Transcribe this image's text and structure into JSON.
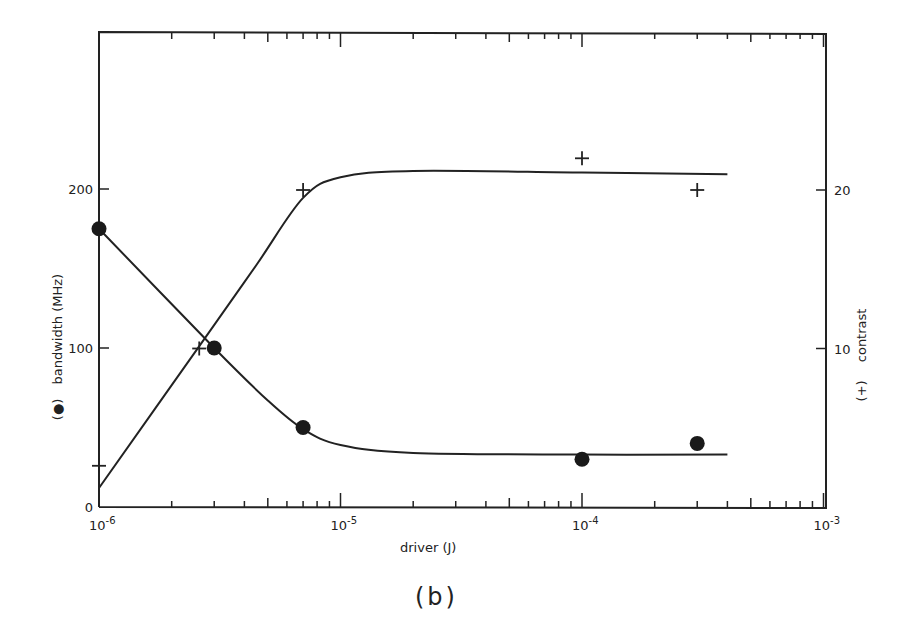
{
  "chart_data": {
    "type": "scatter",
    "title": "",
    "caption": "(b)",
    "xlabel": "driver (J)",
    "ylabel_left": "bandwidth (MHz)",
    "ylabel_left_marker": "(●)",
    "ylabel_right": "contrast",
    "ylabel_right_marker": "(+)",
    "x_scale": "log",
    "xlim": [
      1e-06,
      0.001
    ],
    "x_ticks": [
      {
        "value": 1e-06,
        "base": "10",
        "exp": "-6"
      },
      {
        "value": 1e-05,
        "base": "10",
        "exp": "-5"
      },
      {
        "value": 0.0001,
        "base": "10",
        "exp": "-4"
      },
      {
        "value": 0.001,
        "base": "10",
        "exp": "-3"
      }
    ],
    "ylim_left": [
      0,
      300
    ],
    "y_ticks_left": [
      0,
      100,
      200
    ],
    "ylim_right": [
      0,
      30
    ],
    "y_ticks_right": [
      10,
      20
    ],
    "grid": false,
    "legend": "none (markers identified in axis labels)",
    "series": [
      {
        "name": "bandwidth (MHz)",
        "marker": "filled-circle",
        "axis": "left",
        "points": [
          {
            "x": 1e-06,
            "y": 175
          },
          {
            "x": 3e-06,
            "y": 100
          },
          {
            "x": 7e-06,
            "y": 50
          },
          {
            "x": 0.0001,
            "y": 30
          },
          {
            "x": 0.0003,
            "y": 40
          }
        ],
        "fit_curve": [
          {
            "x": 1e-06,
            "y": 175
          },
          {
            "x": 3e-06,
            "y": 100
          },
          {
            "x": 5e-06,
            "y": 67
          },
          {
            "x": 7e-06,
            "y": 49
          },
          {
            "x": 1e-05,
            "y": 39
          },
          {
            "x": 2e-05,
            "y": 34
          },
          {
            "x": 0.0001,
            "y": 33
          },
          {
            "x": 0.0004,
            "y": 33
          }
        ]
      },
      {
        "name": "contrast",
        "marker": "plus",
        "axis": "right",
        "points": [
          {
            "x": 1e-06,
            "y": 2.6
          },
          {
            "x": 2.6e-06,
            "y": 10
          },
          {
            "x": 7e-06,
            "y": 20
          },
          {
            "x": 0.0001,
            "y": 22
          },
          {
            "x": 0.0003,
            "y": 20
          }
        ],
        "fit_curve": [
          {
            "x": 1e-06,
            "y": 1.2
          },
          {
            "x": 2.7e-06,
            "y": 10.5
          },
          {
            "x": 4.5e-06,
            "y": 15.3
          },
          {
            "x": 7e-06,
            "y": 19.5
          },
          {
            "x": 1e-05,
            "y": 20.8
          },
          {
            "x": 2e-05,
            "y": 21.2
          },
          {
            "x": 0.0001,
            "y": 21.1
          },
          {
            "x": 0.0004,
            "y": 21.0
          }
        ]
      }
    ]
  }
}
